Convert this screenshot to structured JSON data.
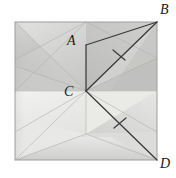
{
  "figure": {
    "kind": "geometry-diagram",
    "background_color": "#ffffff",
    "paper": {
      "outline_color": "#9a9a9a",
      "top_half_fill": "#c9c9c7",
      "bottom_half_fill": "#e3e3e1",
      "crease_color": "#b8b8b6",
      "square": {
        "left": 15,
        "top": 22,
        "right": 157,
        "bottom": 160
      },
      "midline_y": 91
    },
    "line_color": "#3a3a3a",
    "labels": [
      {
        "id": "A",
        "text": "A",
        "x": 67,
        "y": 34
      },
      {
        "id": "B",
        "text": "B",
        "x": 160,
        "y": 3
      },
      {
        "id": "C",
        "text": "C",
        "x": 64,
        "y": 85
      },
      {
        "id": "D",
        "text": "D",
        "x": 160,
        "y": 157
      }
    ],
    "points": {
      "A": {
        "x": 86,
        "y": 45
      },
      "B": {
        "x": 157,
        "y": 22
      },
      "C": {
        "x": 86,
        "y": 91
      },
      "D": {
        "x": 157,
        "y": 160
      }
    },
    "segments": [
      {
        "name": "A-B",
        "from": "A",
        "to": "B"
      },
      {
        "name": "A-C",
        "from": "A",
        "to": "C"
      },
      {
        "name": "C-B",
        "from": "C",
        "to": "B"
      },
      {
        "name": "C-D",
        "from": "C",
        "to": "D"
      }
    ],
    "tick_marks": [
      {
        "name": "tick-on-CB",
        "x": 119,
        "y": 55
      },
      {
        "name": "tick-on-CD",
        "x": 120,
        "y": 123
      }
    ]
  }
}
